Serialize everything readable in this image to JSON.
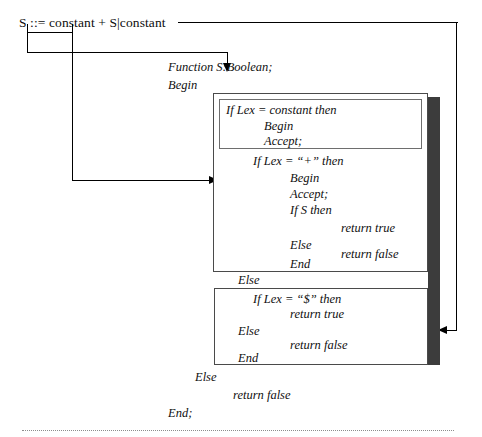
{
  "figure": {
    "grammar_rule": "S ::= constant + S|constant",
    "signature": "Function S:Boolean;",
    "begin": "Begin",
    "end": "End;",
    "else_outer": "Else",
    "return_false_outer": "return false",
    "else_middle": "Else"
  },
  "box1": {
    "lines": [
      "If Lex = constant then",
      "Begin",
      "Accept;"
    ]
  },
  "box2": {
    "lines": [
      "If Lex = “+” then",
      "Begin",
      "Accept;",
      "If S then",
      "return true",
      "Else",
      "return false",
      "End"
    ]
  },
  "box3": {
    "lines": [
      "If Lex = “$” then",
      "return true",
      "Else",
      "return false",
      "End"
    ]
  },
  "colors": {
    "ink": "#111111",
    "box_border": "#4a4a4a",
    "inner_border": "#6e6e6e",
    "shadow": "#3c3c3c",
    "connector": "#000000",
    "rule": "#8d8d8d",
    "background": "#ffffff"
  }
}
